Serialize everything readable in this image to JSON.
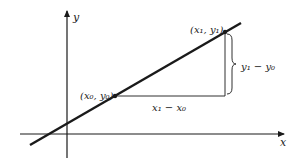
{
  "diagram": {
    "axes": {
      "x_label": "x",
      "y_label": "y"
    },
    "points": [
      {
        "label": "(x0, y0)",
        "x": 115,
        "y": 96
      },
      {
        "label": "(x1, y1)",
        "x": 225,
        "y": 32
      }
    ],
    "labels": {
      "p0": "(x₀, y₀)",
      "p1": "(x₁, y₁)",
      "run": "x₁ − x₀",
      "rise": "y₁ − y₀"
    },
    "colors": {
      "line": "#1a1a1a",
      "background": "#ffffff"
    }
  }
}
